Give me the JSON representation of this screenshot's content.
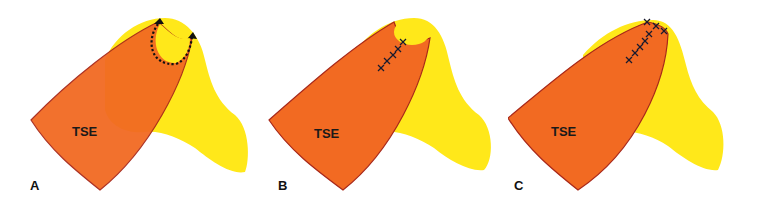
{
  "figure": {
    "colors": {
      "yellow": "#FFE81A",
      "orange_flap": "#F26A22",
      "flap_outline": "#A8281A",
      "overlap_orange": "#F57A1E",
      "suture": "#1a1a2e",
      "arrow": "#111111"
    },
    "panels": [
      {
        "label": "A",
        "flap_label": "TSE",
        "annotation": "dotted rotation arrow"
      },
      {
        "label": "B",
        "flap_label": "TSE",
        "annotation": "suture marks"
      },
      {
        "label": "C",
        "flap_label": "TSE",
        "annotation": "suture marks"
      }
    ]
  }
}
